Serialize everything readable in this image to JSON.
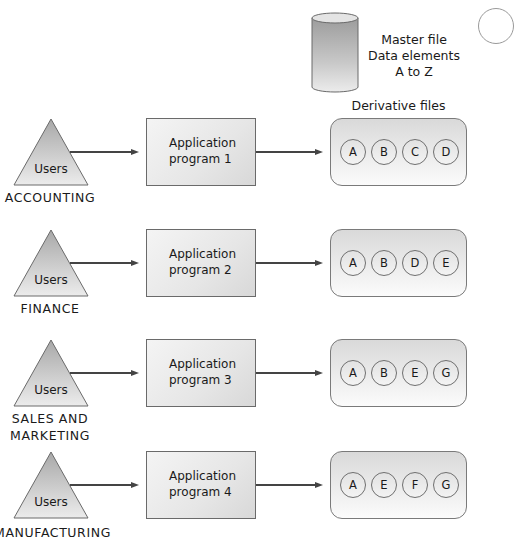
{
  "master_file": {
    "icon": "database-cylinder-icon",
    "lines": [
      "Master file",
      "Data elements",
      "A to Z"
    ]
  },
  "derivative_files_title": "Derivative files",
  "rows": [
    {
      "users_label": "Users",
      "department_lines": [
        "ACCOUNTING"
      ],
      "program_lines": [
        "Application",
        "program 1"
      ],
      "elements": [
        "A",
        "B",
        "C",
        "D"
      ]
    },
    {
      "users_label": "Users",
      "department_lines": [
        "FINANCE"
      ],
      "program_lines": [
        "Application",
        "program 2"
      ],
      "elements": [
        "A",
        "B",
        "D",
        "E"
      ]
    },
    {
      "users_label": "Users",
      "department_lines": [
        "SALES AND",
        "MARKETING"
      ],
      "program_lines": [
        "Application",
        "program 3"
      ],
      "elements": [
        "A",
        "B",
        "E",
        "G"
      ]
    },
    {
      "users_label": "Users",
      "department_lines": [
        "MANUFACTURING"
      ],
      "program_lines": [
        "Application",
        "program 4"
      ],
      "elements": [
        "A",
        "E",
        "F",
        "G"
      ]
    }
  ]
}
